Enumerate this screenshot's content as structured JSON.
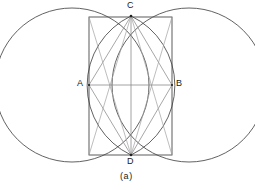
{
  "figure": {
    "caption": "(a)",
    "labels": {
      "a": "A",
      "b": "B",
      "c": "C",
      "d": "D"
    },
    "colors": {
      "stroke_dark": "#333333",
      "stroke_light": "#8a8a8a",
      "background": "#ffffff"
    },
    "geometry": {
      "left_circle": {
        "cx": 72,
        "cy": 85,
        "r": 77
      },
      "right_circle": {
        "cx": 189,
        "cy": 85,
        "r": 77
      },
      "rectangle": {
        "x": 89,
        "y": 17,
        "width": 83,
        "height": 138
      },
      "points": {
        "A": {
          "x": 89,
          "y": 85
        },
        "B": {
          "x": 172,
          "y": 85
        },
        "C": {
          "x": 131,
          "y": 16
        },
        "D": {
          "x": 131,
          "y": 155
        }
      },
      "lens_arc_radius": 77,
      "vertical_axis": {
        "x1": 131,
        "y1": 16,
        "x2": 131,
        "y2": 155
      },
      "horizontal_axis": {
        "x1": 89,
        "y1": 85,
        "x2": 172,
        "y2": 85
      }
    }
  }
}
